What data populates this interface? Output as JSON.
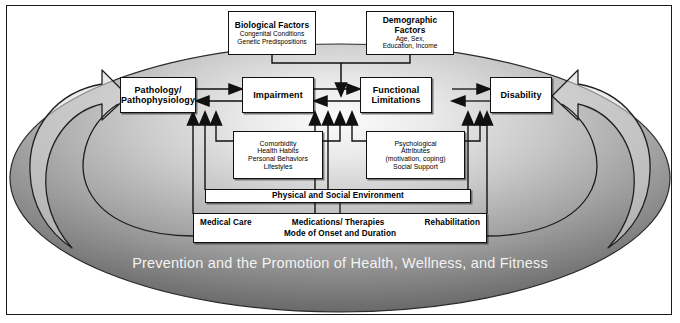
{
  "diagram": {
    "title_banner": "Prevention and the Promotion of Health, Wellness, and Fitness",
    "colors": {
      "oval_outer": "#f4f4f4",
      "oval_inner": "#5d5d5d",
      "line": "#111111",
      "box_fill": "#ffffff",
      "banner_text": "#f2f2f2"
    },
    "top_factors": [
      {
        "id": "biological-factors",
        "title": "Biological Factors",
        "lines": [
          "Congenital Conditions",
          "Genetic Predispositions"
        ]
      },
      {
        "id": "demographic-factors",
        "title": "Demographic Factors",
        "lines": [
          "Age, Sex,",
          "Education, Income"
        ]
      }
    ],
    "main_chain": [
      {
        "id": "pathology",
        "lines": [
          "Pathology/",
          "Pathophysiology"
        ]
      },
      {
        "id": "impairment",
        "lines": [
          "Impairment"
        ]
      },
      {
        "id": "functional-limitations",
        "lines": [
          "Functional",
          "Limitations"
        ]
      },
      {
        "id": "disability",
        "lines": [
          "Disability"
        ]
      }
    ],
    "modifiers": [
      {
        "id": "comorbidity",
        "lines": [
          "Comorbidity",
          "Health Habits",
          "Personal Behaviors",
          "Lifestyles"
        ]
      },
      {
        "id": "psychological-attributes",
        "lines": [
          "Psychological",
          "Attributes",
          "(motivation, coping)",
          "Social Support"
        ]
      }
    ],
    "environment_bar": {
      "id": "physical-social-environment",
      "text": "Physical and Social Environment"
    },
    "intervention_bar": {
      "id": "medical-care",
      "line1": [
        "Medical Care",
        "Medications/ Therapies",
        "Rehabilitation"
      ],
      "line2": "Mode of Onset and Duration"
    },
    "arrows": {
      "bidirectional_pairs": [
        [
          "pathology",
          "impairment"
        ],
        [
          "impairment",
          "functional-limitations"
        ],
        [
          "functional-limitations",
          "disability"
        ]
      ],
      "top_down_into": "between-impairment-and-functional-limitations",
      "feedback_loop_left": "curved arrow into Pathology/Pathophysiology",
      "feedback_loop_right": "curved arrow into Disability"
    }
  }
}
